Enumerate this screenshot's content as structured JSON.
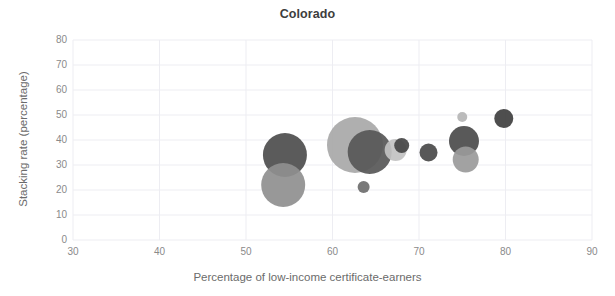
{
  "chart_data": {
    "type": "scatter",
    "title": "Colorado",
    "xlabel": "Percentage of low-income certificate-earners",
    "ylabel": "Stacking rate (percentage)",
    "xlim": [
      30,
      90
    ],
    "ylim": [
      0,
      80
    ],
    "xticks": [
      30,
      40,
      50,
      60,
      70,
      80,
      90
    ],
    "yticks": [
      0,
      10,
      20,
      30,
      40,
      50,
      60,
      70,
      80
    ],
    "grid": true,
    "legend": "none",
    "size_encoding": "bubble radius encodes institution size",
    "points": [
      {
        "label": "bubble-1",
        "x": 54.5,
        "y": 34.0,
        "r": 22.0,
        "color": "#4d4d4d"
      },
      {
        "label": "bubble-2",
        "x": 54.3,
        "y": 22.0,
        "r": 22.0,
        "color": "#8f8f8f"
      },
      {
        "label": "bubble-3",
        "x": 62.6,
        "y": 38.0,
        "r": 28.0,
        "color": "#a8a8a8"
      },
      {
        "label": "bubble-4",
        "x": 64.3,
        "y": 35.2,
        "r": 22.0,
        "color": "#575757"
      },
      {
        "label": "bubble-5",
        "x": 63.6,
        "y": 21.2,
        "r": 6.0,
        "color": "#6e6e6e"
      },
      {
        "label": "bubble-6",
        "x": 67.3,
        "y": 36.0,
        "r": 11.0,
        "color": "#c2c2c2"
      },
      {
        "label": "bubble-7",
        "x": 68.0,
        "y": 37.8,
        "r": 7.5,
        "color": "#454545"
      },
      {
        "label": "bubble-8",
        "x": 71.1,
        "y": 35.0,
        "r": 9.0,
        "color": "#4a4a4a"
      },
      {
        "label": "bubble-9",
        "x": 75.0,
        "y": 49.2,
        "r": 5.0,
        "color": "#b5b5b5"
      },
      {
        "label": "bubble-10",
        "x": 75.2,
        "y": 39.6,
        "r": 15.0,
        "color": "#4b4b4b"
      },
      {
        "label": "bubble-11",
        "x": 75.4,
        "y": 32.2,
        "r": 13.0,
        "color": "#9a9a9a"
      },
      {
        "label": "bubble-12",
        "x": 79.8,
        "y": 48.6,
        "r": 9.5,
        "color": "#3f3f3f"
      }
    ],
    "style": {
      "grid_color": "#ededf2",
      "axis_line_color": "#e2e2e8",
      "tick_text_color": "#8a8a8a",
      "title_color": "#3d3d3d",
      "background": "#ffffff"
    }
  }
}
